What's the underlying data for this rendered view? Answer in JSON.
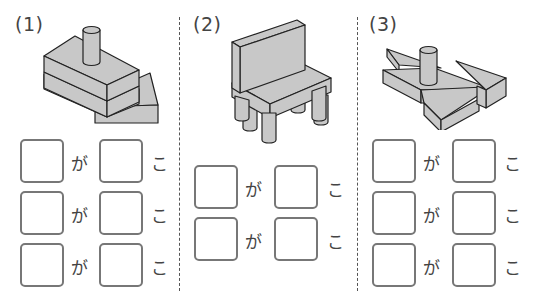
{
  "worksheet": {
    "problems": [
      {
        "label": "(1)",
        "figure": "stacked-blocks-with-cylinder-and-triangle-prism",
        "rows": [
          {
            "particle": "が",
            "counter": "こ"
          },
          {
            "particle": "が",
            "counter": "こ"
          },
          {
            "particle": "が",
            "counter": "こ"
          }
        ]
      },
      {
        "label": "(2)",
        "figure": "chair-made-of-blocks-and-cylinders",
        "rows": [
          {
            "particle": "が",
            "counter": "こ"
          },
          {
            "particle": "が",
            "counter": "こ"
          }
        ]
      },
      {
        "label": "(3)",
        "figure": "flat-blocks-with-triangles-and-cylinder",
        "rows": [
          {
            "particle": "が",
            "counter": "こ"
          },
          {
            "particle": "が",
            "counter": "こ"
          },
          {
            "particle": "が",
            "counter": "こ"
          }
        ]
      }
    ],
    "colors": {
      "shape_fill": "#c8c8c8",
      "shape_stroke": "#222222",
      "box_border": "#777777",
      "divider": "#555555"
    }
  }
}
